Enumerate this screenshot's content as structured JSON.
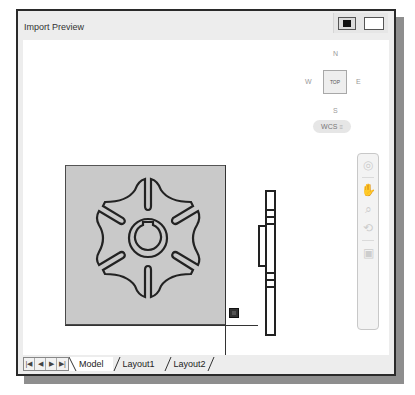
{
  "window": {
    "title": "Import Preview",
    "titlebar_buttons": [
      {
        "name": "dark-background-toggle",
        "style": "filled"
      },
      {
        "name": "light-background-toggle",
        "style": "white"
      }
    ]
  },
  "viewcube": {
    "north": "N",
    "south": "S",
    "west": "W",
    "east": "E",
    "face": "TOP",
    "coordinate_system": "WCS",
    "coordinate_dropdown_icon": "chevron-down-icon"
  },
  "navigation_bar": {
    "tools": [
      {
        "icon": "steering-wheel-icon",
        "glyph": "◎"
      },
      {
        "icon": "pan-icon",
        "glyph": "✋"
      },
      {
        "icon": "zoom-extents-icon",
        "glyph": "⌕"
      },
      {
        "icon": "orbit-icon",
        "glyph": "⟲"
      },
      {
        "icon": "showmotion-icon",
        "glyph": "▣"
      }
    ]
  },
  "drawing": {
    "paper_color": "#c9c9c9",
    "geometry_color": "#222222",
    "views": [
      "front-view-geneva-wheel",
      "side-view-section"
    ]
  },
  "layout_tabs": {
    "nav_buttons": [
      "|◀",
      "◀",
      "▶",
      "▶|"
    ],
    "tabs": [
      {
        "label": "Model",
        "active": true
      },
      {
        "label": "Layout1",
        "active": false
      },
      {
        "label": "Layout2",
        "active": false
      }
    ]
  }
}
